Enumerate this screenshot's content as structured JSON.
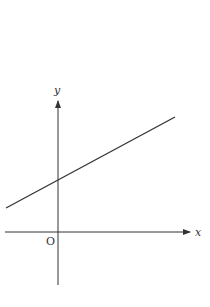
{
  "diagram": {
    "type": "coordinate-plane-line",
    "axes": {
      "x_label": "x",
      "y_label": "y",
      "origin_label": "O"
    },
    "line": {
      "description": "straight line with positive slope and positive y-intercept",
      "color": "#333333"
    },
    "colors": {
      "axis": "#333333",
      "background": "#ffffff"
    }
  }
}
